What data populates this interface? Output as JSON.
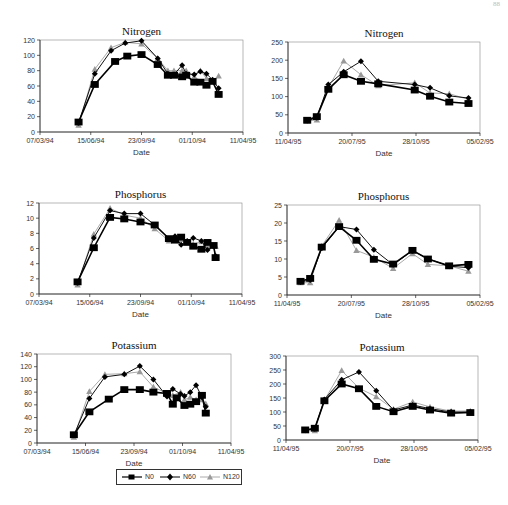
{
  "page": {
    "number_fragment": "88"
  },
  "legend": {
    "items": [
      {
        "label": "N0",
        "marker": "square",
        "color": "#000000"
      },
      {
        "label": "N60",
        "marker": "diamond",
        "color": "#000000"
      },
      {
        "label": "N120",
        "marker": "triangle",
        "color": "#999999"
      }
    ]
  },
  "chart_data": [
    {
      "id": "nitrogen-1994",
      "type": "line",
      "title": "Nitrogen",
      "xlabel": "Date",
      "ylabel": "",
      "x_ticks": [
        "07/03/94",
        "15/06/94",
        "23/09/94",
        "01/10/94",
        "11/04/95"
      ],
      "ylim": [
        0,
        120
      ],
      "y_ticks": [
        0,
        20,
        40,
        60,
        80,
        100,
        120
      ],
      "frame": {
        "x0": 40,
        "x1": 243,
        "y0": 40,
        "y1": 132
      },
      "series": [
        {
          "name": "N0",
          "x": [
            0.19,
            0.27,
            0.37,
            0.43,
            0.5,
            0.58,
            0.63,
            0.66,
            0.7,
            0.72,
            0.76,
            0.79,
            0.82,
            0.85,
            0.88
          ],
          "values": [
            13,
            62,
            92,
            99,
            101,
            88,
            74,
            74,
            72,
            74,
            65,
            65,
            61,
            66,
            49
          ]
        },
        {
          "name": "N60",
          "x": [
            0.19,
            0.27,
            0.35,
            0.42,
            0.5,
            0.58,
            0.63,
            0.66,
            0.7,
            0.72,
            0.76,
            0.79,
            0.82,
            0.85,
            0.88
          ],
          "values": [
            12,
            76,
            106,
            116,
            119,
            96,
            76,
            75,
            87,
            76,
            75,
            79,
            76,
            68,
            57
          ]
        },
        {
          "name": "N120",
          "x": [
            0.19,
            0.27,
            0.35,
            0.42,
            0.5,
            0.58,
            0.63,
            0.66,
            0.7,
            0.72,
            0.76,
            0.79,
            0.82,
            0.85,
            0.88
          ],
          "values": [
            9,
            82,
            110,
            117,
            115,
            96,
            80,
            80,
            80,
            80,
            72,
            80,
            70,
            67,
            73
          ]
        }
      ]
    },
    {
      "id": "nitrogen-1995",
      "type": "line",
      "title": "Nitrogen",
      "xlabel": "Date",
      "ylabel": "",
      "x_ticks": [
        "11/04/95",
        "20/07/95",
        "28/10/95",
        "05/02/95"
      ],
      "ylim": [
        0,
        250
      ],
      "y_ticks": [
        0,
        50,
        100,
        150,
        200,
        250
      ],
      "frame": {
        "x0": 288,
        "x1": 480,
        "y0": 42,
        "y1": 133
      },
      "series": [
        {
          "name": "N0",
          "x": [
            0.1,
            0.15,
            0.21,
            0.29,
            0.38,
            0.47,
            0.66,
            0.74,
            0.84,
            0.94
          ],
          "values": [
            35,
            45,
            120,
            160,
            142,
            135,
            118,
            101,
            85,
            81
          ]
        },
        {
          "name": "N60",
          "x": [
            0.1,
            0.15,
            0.21,
            0.29,
            0.38,
            0.47,
            0.66,
            0.74,
            0.84,
            0.94
          ],
          "values": [
            34,
            42,
            133,
            168,
            197,
            142,
            133,
            124,
            102,
            96
          ]
        },
        {
          "name": "N120",
          "x": [
            0.1,
            0.15,
            0.21,
            0.29,
            0.38,
            0.47,
            0.66,
            0.74,
            0.84,
            0.94
          ],
          "values": [
            33,
            36,
            125,
            198,
            160,
            130,
            138,
            110,
            108,
            92
          ]
        }
      ]
    },
    {
      "id": "phosphorus-1994",
      "type": "line",
      "title": "Phosphorus",
      "xlabel": "Date",
      "ylabel": "",
      "x_ticks": [
        "07/03/94",
        "15/06/94",
        "23/09/94",
        "01/10/94",
        "11/04/95"
      ],
      "ylim": [
        0,
        12
      ],
      "y_ticks": [
        0,
        2,
        4,
        6,
        8,
        10,
        12
      ],
      "frame": {
        "x0": 39,
        "x1": 242,
        "y0": 203,
        "y1": 294
      },
      "series": [
        {
          "name": "N0",
          "x": [
            0.19,
            0.27,
            0.35,
            0.42,
            0.5,
            0.57,
            0.64,
            0.67,
            0.7,
            0.73,
            0.76,
            0.8,
            0.83,
            0.86,
            0.87
          ],
          "values": [
            1.6,
            6.1,
            10.1,
            9.9,
            9.5,
            9.1,
            7.3,
            7.1,
            7.5,
            6.8,
            6.3,
            5.9,
            6.8,
            6.4,
            4.8
          ]
        },
        {
          "name": "N60",
          "x": [
            0.19,
            0.27,
            0.35,
            0.42,
            0.5,
            0.57,
            0.64,
            0.67,
            0.7,
            0.73,
            0.76,
            0.8,
            0.83,
            0.86,
            0.87
          ],
          "values": [
            1.5,
            7.4,
            11.0,
            10.6,
            10.6,
            9.1,
            7.3,
            7.6,
            6.5,
            7.0,
            7.4,
            7.0,
            5.8,
            6.3,
            5.0
          ]
        },
        {
          "name": "N120",
          "x": [
            0.19,
            0.27,
            0.35,
            0.42,
            0.5,
            0.57,
            0.64,
            0.67,
            0.7,
            0.73,
            0.76,
            0.8,
            0.83,
            0.86,
            0.87
          ],
          "values": [
            1.2,
            7.9,
            11.3,
            10.4,
            10.0,
            8.6,
            7.0,
            7.3,
            7.2,
            6.9,
            6.6,
            6.9,
            6.2,
            6.4,
            6.3
          ]
        }
      ]
    },
    {
      "id": "phosphorus-1995",
      "type": "line",
      "title": "Phosphorus",
      "xlabel": "Date",
      "ylabel": "",
      "x_ticks": [
        "11/04/95",
        "20/07/95",
        "28/10/95",
        "05/02/95"
      ],
      "ylim": [
        0,
        25
      ],
      "y_ticks": [
        0,
        5,
        10,
        15,
        20,
        25
      ],
      "frame": {
        "x0": 287,
        "x1": 480,
        "y0": 205,
        "y1": 295
      },
      "series": [
        {
          "name": "N0",
          "x": [
            0.07,
            0.12,
            0.18,
            0.27,
            0.36,
            0.45,
            0.55,
            0.65,
            0.73,
            0.84,
            0.94
          ],
          "values": [
            3.8,
            4.6,
            13.3,
            19.0,
            15.2,
            9.9,
            8.6,
            12.4,
            10.0,
            8.1,
            8.5
          ]
        },
        {
          "name": "N60",
          "x": [
            0.07,
            0.12,
            0.18,
            0.27,
            0.36,
            0.45,
            0.55,
            0.65,
            0.73,
            0.84,
            0.94
          ],
          "values": [
            3.6,
            4.2,
            13.0,
            19.0,
            18.2,
            12.6,
            8.4,
            12.3,
            10.1,
            8.0,
            7.6
          ]
        },
        {
          "name": "N120",
          "x": [
            0.07,
            0.12,
            0.18,
            0.27,
            0.36,
            0.45,
            0.55,
            0.65,
            0.73,
            0.84,
            0.94
          ],
          "values": [
            3.4,
            3.4,
            13.6,
            20.8,
            12.4,
            10.5,
            7.4,
            11.5,
            8.5,
            8.1,
            6.6
          ]
        }
      ]
    },
    {
      "id": "potassium-1994",
      "type": "line",
      "title": "Potassium",
      "xlabel": "Date",
      "ylabel": "",
      "x_ticks": [
        "07/03/94",
        "15/06/94",
        "23/09/94",
        "01/10/94",
        "11/04/95"
      ],
      "ylim": [
        0,
        140
      ],
      "y_ticks": [
        0,
        20,
        40,
        60,
        80,
        100,
        120,
        140
      ],
      "frame": {
        "x0": 37,
        "x1": 231,
        "y0": 354,
        "y1": 443
      },
      "series": [
        {
          "name": "N0",
          "x": [
            0.19,
            0.27,
            0.37,
            0.45,
            0.53,
            0.6,
            0.67,
            0.7,
            0.72,
            0.76,
            0.79,
            0.82,
            0.85,
            0.87
          ],
          "values": [
            13,
            49,
            69,
            84,
            84,
            80,
            78,
            61,
            71,
            59,
            61,
            65,
            75,
            47
          ]
        },
        {
          "name": "N60",
          "x": [
            0.19,
            0.27,
            0.35,
            0.45,
            0.53,
            0.6,
            0.67,
            0.7,
            0.74,
            0.76,
            0.79,
            0.82,
            0.85,
            0.87
          ],
          "values": [
            12,
            70,
            104,
            108,
            121,
            100,
            73,
            85,
            77,
            74,
            80,
            91,
            72,
            57
          ]
        },
        {
          "name": "N120",
          "x": [
            0.19,
            0.27,
            0.35,
            0.45,
            0.53,
            0.6,
            0.67,
            0.7,
            0.74,
            0.76,
            0.79,
            0.82,
            0.85,
            0.87
          ],
          "values": [
            9,
            81,
            108,
            109,
            112,
            88,
            78,
            75,
            80,
            68,
            72,
            68,
            68,
            62
          ]
        }
      ]
    },
    {
      "id": "potassium-1995",
      "type": "line",
      "title": "Potassium",
      "xlabel": "Date",
      "ylabel": "",
      "x_ticks": [
        "11/04/95",
        "20/07/95",
        "28/10/95",
        "05/02/95"
      ],
      "ylim": [
        0,
        300
      ],
      "y_ticks": [
        0,
        50,
        100,
        150,
        200,
        250,
        300
      ],
      "frame": {
        "x0": 286,
        "x1": 478,
        "y0": 356,
        "y1": 440
      },
      "series": [
        {
          "name": "N0",
          "x": [
            0.1,
            0.15,
            0.2,
            0.29,
            0.38,
            0.47,
            0.56,
            0.66,
            0.75,
            0.86,
            0.96
          ],
          "values": [
            36,
            42,
            140,
            200,
            183,
            120,
            101,
            120,
            107,
            96,
            98
          ]
        },
        {
          "name": "N60",
          "x": [
            0.1,
            0.15,
            0.2,
            0.29,
            0.38,
            0.47,
            0.56,
            0.66,
            0.75,
            0.86,
            0.96
          ],
          "values": [
            35,
            40,
            145,
            215,
            243,
            176,
            107,
            125,
            112,
            100,
            100
          ]
        },
        {
          "name": "N120",
          "x": [
            0.1,
            0.15,
            0.2,
            0.29,
            0.38,
            0.47,
            0.56,
            0.66,
            0.75,
            0.86,
            0.96
          ],
          "values": [
            34,
            33,
            142,
            248,
            185,
            155,
            110,
            136,
            118,
            103,
            104
          ]
        }
      ]
    }
  ]
}
